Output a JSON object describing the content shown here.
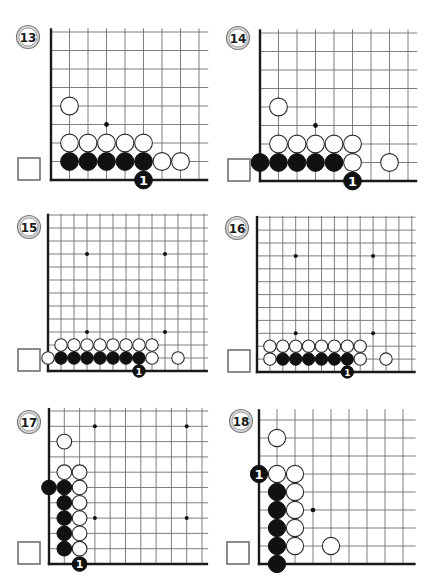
{
  "colors": {
    "grid": "#6f6f6f",
    "edge": "#1a1a1a",
    "black_stone": "#111111",
    "white_stone": "#ffffff",
    "label_ring": "#d8d8d8"
  },
  "diagrams": [
    {
      "label": "13",
      "label_center": [
        28,
        37
      ],
      "origin": [
        51,
        180
      ],
      "spacing": 18.5,
      "cols_right": 8.5,
      "rows_up": 8.2,
      "box": [
        18,
        158,
        22
      ],
      "stars": [
        [
          3,
          3
        ]
      ],
      "white": [
        [
          1,
          4
        ],
        [
          1,
          2
        ],
        [
          2,
          2
        ],
        [
          3,
          2
        ],
        [
          4,
          2
        ],
        [
          5,
          2
        ],
        [
          6,
          1
        ],
        [
          7,
          1
        ]
      ],
      "black": [
        [
          1,
          1
        ],
        [
          2,
          1
        ],
        [
          3,
          1
        ],
        [
          4,
          1
        ],
        [
          5,
          1
        ]
      ],
      "moves": [
        {
          "col": 5,
          "row": 0,
          "color": "black",
          "number": "1"
        }
      ]
    },
    {
      "label": "14",
      "label_center": [
        238,
        38
      ],
      "origin": [
        260,
        181
      ],
      "spacing": 18.5,
      "cols_right": 8.5,
      "rows_up": 8.2,
      "box": [
        228,
        159,
        22
      ],
      "stars": [
        [
          3,
          3
        ]
      ],
      "white": [
        [
          1,
          4
        ],
        [
          1,
          2
        ],
        [
          2,
          2
        ],
        [
          3,
          2
        ],
        [
          4,
          2
        ],
        [
          5,
          2
        ],
        [
          5,
          1
        ],
        [
          7,
          1
        ]
      ],
      "black": [
        [
          0,
          1
        ],
        [
          1,
          1
        ],
        [
          2,
          1
        ],
        [
          3,
          1
        ],
        [
          4,
          1
        ]
      ],
      "moves": [
        {
          "col": 5,
          "row": 0,
          "color": "black",
          "number": "1"
        }
      ]
    },
    {
      "label": "15",
      "label_center": [
        29,
        227
      ],
      "origin": [
        48,
        371
      ],
      "spacing": 13,
      "cols_right": 12.3,
      "rows_up": 12.1,
      "box": [
        18,
        349,
        22
      ],
      "stars": [
        [
          3,
          3
        ],
        [
          9,
          3
        ],
        [
          3,
          9
        ],
        [
          9,
          9
        ]
      ],
      "white": [
        [
          0,
          1
        ],
        [
          8,
          1
        ],
        [
          10,
          1
        ],
        [
          1,
          2
        ],
        [
          2,
          2
        ],
        [
          3,
          2
        ],
        [
          4,
          2
        ],
        [
          5,
          2
        ],
        [
          6,
          2
        ],
        [
          7,
          2
        ],
        [
          8,
          2
        ]
      ],
      "black": [
        [
          1,
          1
        ],
        [
          2,
          1
        ],
        [
          3,
          1
        ],
        [
          4,
          1
        ],
        [
          5,
          1
        ],
        [
          6,
          1
        ],
        [
          7,
          1
        ]
      ],
      "moves": [
        {
          "col": 7,
          "row": 0,
          "color": "black",
          "number": "1"
        }
      ]
    },
    {
      "label": "16",
      "label_center": [
        237,
        228
      ],
      "origin": [
        257,
        372
      ],
      "spacing": 12.9,
      "cols_right": 12.3,
      "rows_up": 12.1,
      "box": [
        228,
        350,
        22
      ],
      "stars": [
        [
          3,
          3
        ],
        [
          9,
          3
        ],
        [
          3,
          9
        ],
        [
          9,
          9
        ]
      ],
      "white": [
        [
          1,
          1
        ],
        [
          8,
          1
        ],
        [
          10,
          1
        ],
        [
          1,
          2
        ],
        [
          2,
          2
        ],
        [
          3,
          2
        ],
        [
          4,
          2
        ],
        [
          5,
          2
        ],
        [
          6,
          2
        ],
        [
          7,
          2
        ],
        [
          8,
          2
        ]
      ],
      "black": [
        [
          2,
          1
        ],
        [
          3,
          1
        ],
        [
          4,
          1
        ],
        [
          5,
          1
        ],
        [
          6,
          1
        ],
        [
          7,
          1
        ]
      ],
      "moves": [
        {
          "col": 7,
          "row": 0,
          "color": "black",
          "number": "1"
        }
      ]
    },
    {
      "label": "17",
      "label_center": [
        29,
        422
      ],
      "origin": [
        49,
        564
      ],
      "spacing": 15.3,
      "cols_right": 10.4,
      "rows_up": 10.2,
      "box": [
        18,
        542,
        22
      ],
      "stars": [
        [
          3,
          3
        ],
        [
          9,
          3
        ],
        [
          3,
          9
        ],
        [
          9,
          9
        ]
      ],
      "white": [
        [
          1,
          8
        ],
        [
          1,
          6
        ],
        [
          2,
          6
        ],
        [
          2,
          5
        ],
        [
          2,
          4
        ],
        [
          2,
          3
        ],
        [
          2,
          2
        ],
        [
          2,
          1
        ]
      ],
      "black": [
        [
          0,
          5
        ],
        [
          1,
          5
        ],
        [
          1,
          4
        ],
        [
          1,
          3
        ],
        [
          1,
          2
        ],
        [
          1,
          1
        ]
      ],
      "moves": [
        {
          "col": 2,
          "row": 0,
          "color": "black",
          "number": "1"
        }
      ]
    },
    {
      "label": "18",
      "label_center": [
        241,
        421
      ],
      "origin": [
        259,
        564
      ],
      "spacing": 18,
      "cols_right": 8.7,
      "rows_up": 8.6,
      "box": [
        227,
        542,
        22
      ],
      "stars": [
        [
          3,
          3
        ]
      ],
      "white": [
        [
          1,
          7
        ],
        [
          1,
          5
        ],
        [
          2,
          5
        ],
        [
          2,
          4
        ],
        [
          2,
          3
        ],
        [
          2,
          2
        ],
        [
          2,
          1
        ],
        [
          4,
          1
        ]
      ],
      "black": [
        [
          1,
          4
        ],
        [
          1,
          3
        ],
        [
          1,
          2
        ],
        [
          1,
          1
        ],
        [
          1,
          0
        ]
      ],
      "moves": [
        {
          "col": 0,
          "row": 5,
          "color": "black",
          "number": "1"
        }
      ]
    }
  ]
}
